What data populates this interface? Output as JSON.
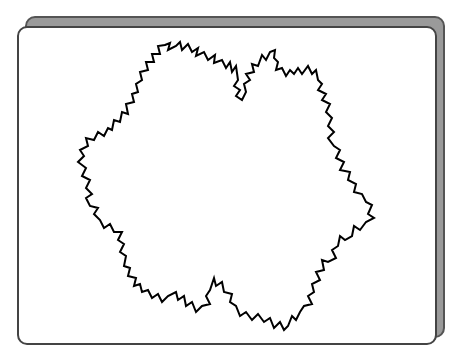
{
  "window": {
    "frame_color": "#9a9a9a",
    "panel_color": "#ffffff",
    "border_color": "#444444"
  },
  "drawing": {
    "type": "random-koch-snowflake-fractal",
    "stroke": "#000000",
    "stroke_width": 2,
    "points": [
      [
        165,
        45
      ],
      [
        170,
        43
      ],
      [
        168,
        50
      ],
      [
        176,
        46
      ],
      [
        180,
        42
      ],
      [
        182,
        50
      ],
      [
        188,
        44
      ],
      [
        192,
        52
      ],
      [
        198,
        48
      ],
      [
        196,
        56
      ],
      [
        204,
        52
      ],
      [
        208,
        60
      ],
      [
        215,
        55
      ],
      [
        214,
        63
      ],
      [
        222,
        60
      ],
      [
        226,
        68
      ],
      [
        230,
        62
      ],
      [
        232,
        72
      ],
      [
        236,
        66
      ],
      [
        238,
        80
      ],
      [
        234,
        86
      ],
      [
        240,
        90
      ],
      [
        236,
        96
      ],
      [
        242,
        100
      ],
      [
        246,
        92
      ],
      [
        244,
        84
      ],
      [
        250,
        80
      ],
      [
        246,
        74
      ],
      [
        254,
        72
      ],
      [
        252,
        64
      ],
      [
        258,
        66
      ],
      [
        262,
        55
      ],
      [
        266,
        60
      ],
      [
        270,
        52
      ],
      [
        275,
        50
      ],
      [
        274,
        58
      ],
      [
        278,
        62
      ],
      [
        276,
        70
      ],
      [
        282,
        68
      ],
      [
        286,
        76
      ],
      [
        290,
        70
      ],
      [
        294,
        74
      ],
      [
        298,
        68
      ],
      [
        302,
        74
      ],
      [
        308,
        66
      ],
      [
        312,
        74
      ],
      [
        316,
        70
      ],
      [
        318,
        80
      ],
      [
        322,
        84
      ],
      [
        318,
        90
      ],
      [
        326,
        94
      ],
      [
        322,
        100
      ],
      [
        330,
        104
      ],
      [
        326,
        112
      ],
      [
        332,
        118
      ],
      [
        328,
        126
      ],
      [
        334,
        132
      ],
      [
        328,
        138
      ],
      [
        334,
        146
      ],
      [
        340,
        150
      ],
      [
        336,
        158
      ],
      [
        344,
        162
      ],
      [
        340,
        170
      ],
      [
        350,
        172
      ],
      [
        348,
        180
      ],
      [
        356,
        184
      ],
      [
        354,
        192
      ],
      [
        362,
        194
      ],
      [
        366,
        202
      ],
      [
        372,
        205
      ],
      [
        368,
        214
      ],
      [
        374,
        218
      ],
      [
        366,
        222
      ],
      [
        360,
        230
      ],
      [
        354,
        226
      ],
      [
        352,
        236
      ],
      [
        345,
        240
      ],
      [
        340,
        236
      ],
      [
        338,
        246
      ],
      [
        332,
        250
      ],
      [
        336,
        258
      ],
      [
        328,
        262
      ],
      [
        322,
        260
      ],
      [
        324,
        270
      ],
      [
        316,
        272
      ],
      [
        320,
        280
      ],
      [
        312,
        284
      ],
      [
        314,
        292
      ],
      [
        308,
        296
      ],
      [
        312,
        304
      ],
      [
        304,
        306
      ],
      [
        300,
        312
      ],
      [
        296,
        320
      ],
      [
        292,
        316
      ],
      [
        288,
        326
      ],
      [
        284,
        330
      ],
      [
        280,
        322
      ],
      [
        274,
        328
      ],
      [
        270,
        318
      ],
      [
        264,
        322
      ],
      [
        258,
        314
      ],
      [
        252,
        320
      ],
      [
        246,
        312
      ],
      [
        240,
        316
      ],
      [
        236,
        306
      ],
      [
        230,
        302
      ],
      [
        232,
        294
      ],
      [
        224,
        292
      ],
      [
        222,
        282
      ],
      [
        216,
        286
      ],
      [
        214,
        278
      ],
      [
        210,
        290
      ],
      [
        206,
        296
      ],
      [
        210,
        304
      ],
      [
        202,
        306
      ],
      [
        196,
        312
      ],
      [
        192,
        302
      ],
      [
        186,
        306
      ],
      [
        184,
        296
      ],
      [
        178,
        300
      ],
      [
        176,
        292
      ],
      [
        168,
        296
      ],
      [
        162,
        302
      ],
      [
        158,
        294
      ],
      [
        152,
        298
      ],
      [
        148,
        290
      ],
      [
        142,
        292
      ],
      [
        140,
        284
      ],
      [
        134,
        286
      ],
      [
        136,
        278
      ],
      [
        128,
        276
      ],
      [
        130,
        268
      ],
      [
        124,
        266
      ],
      [
        126,
        256
      ],
      [
        120,
        252
      ],
      [
        124,
        244
      ],
      [
        118,
        240
      ],
      [
        122,
        232
      ],
      [
        114,
        232
      ],
      [
        110,
        224
      ],
      [
        104,
        228
      ],
      [
        100,
        220
      ],
      [
        94,
        214
      ],
      [
        98,
        208
      ],
      [
        90,
        206
      ],
      [
        86,
        198
      ],
      [
        92,
        194
      ],
      [
        86,
        188
      ],
      [
        90,
        180
      ],
      [
        82,
        176
      ],
      [
        86,
        168
      ],
      [
        78,
        162
      ],
      [
        84,
        156
      ],
      [
        80,
        150
      ],
      [
        88,
        146
      ],
      [
        86,
        138
      ],
      [
        94,
        140
      ],
      [
        98,
        132
      ],
      [
        104,
        136
      ],
      [
        108,
        128
      ],
      [
        112,
        130
      ],
      [
        114,
        120
      ],
      [
        120,
        122
      ],
      [
        122,
        112
      ],
      [
        128,
        114
      ],
      [
        126,
        104
      ],
      [
        134,
        102
      ],
      [
        132,
        94
      ],
      [
        138,
        92
      ],
      [
        136,
        84
      ],
      [
        142,
        80
      ],
      [
        140,
        72
      ],
      [
        148,
        70
      ],
      [
        146,
        62
      ],
      [
        154,
        62
      ],
      [
        152,
        54
      ],
      [
        160,
        54
      ],
      [
        158,
        46
      ],
      [
        165,
        45
      ]
    ]
  }
}
